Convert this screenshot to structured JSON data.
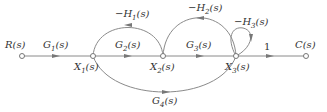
{
  "diagram": {
    "type": "signal-flow-graph",
    "colors": {
      "line": "#8a8a8a",
      "arrow": "#777777",
      "text": "#333333",
      "node_fill": "#ffffff"
    },
    "nodes": [
      {
        "id": "R",
        "label": "R(s)",
        "x": 22,
        "y": 56
      },
      {
        "id": "X1",
        "label": "X1(s)",
        "x": 93,
        "y": 56
      },
      {
        "id": "X2",
        "label": "X2(s)",
        "x": 163,
        "y": 56
      },
      {
        "id": "X3",
        "label": "X3(s)",
        "x": 236,
        "y": 56
      },
      {
        "id": "C",
        "label": "C(s)",
        "x": 306,
        "y": 56
      }
    ],
    "branches": [
      {
        "from": "R",
        "to": "X1",
        "gain": "G1(s)"
      },
      {
        "from": "X1",
        "to": "X2",
        "gain": "G2(s)"
      },
      {
        "from": "X2",
        "to": "X3",
        "gain": "G3(s)"
      },
      {
        "from": "X3",
        "to": "C",
        "gain": "1"
      },
      {
        "from": "X2",
        "to": "X1",
        "gain": "-H1(s)"
      },
      {
        "from": "X3",
        "to": "X2",
        "gain": "-H2(s)"
      },
      {
        "from": "X3",
        "to": "X3",
        "gain": "-H3(s)"
      },
      {
        "from": "X1",
        "to": "X3",
        "gain": "G4(s)"
      }
    ],
    "labels": {
      "R": "R(s)",
      "C": "C(s)",
      "X1": "X",
      "X1_sub": "1",
      "X2": "X",
      "X2_sub": "2",
      "X3": "X",
      "X3_sub": "3",
      "G1": "G",
      "G1_sub": "1",
      "G2": "G",
      "G2_sub": "2",
      "G3": "G",
      "G3_sub": "3",
      "G4": "G",
      "G4_sub": "4",
      "H1": "−H",
      "H1_sub": "1",
      "H2": "−H",
      "H2_sub": "2",
      "H3": "−H",
      "H3_sub": "3",
      "s_suffix": "(s)",
      "unity": "1"
    }
  }
}
